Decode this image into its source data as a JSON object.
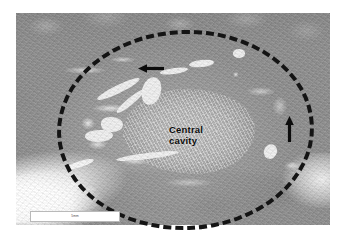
{
  "figure": {
    "type": "histopathology-micrograph",
    "modality": "grayscale low-power light microscopy",
    "annotations": {
      "region_outline": {
        "name": "dashed-ellipse",
        "style": "dashed",
        "color": "#141414",
        "meaning": "outlined lesion / tumour boundary"
      },
      "arrows": [
        {
          "name": "arrow-left",
          "direction": "left",
          "color": "#0c0c0c"
        },
        {
          "name": "arrow-up",
          "direction": "up",
          "color": "#0c0c0c"
        }
      ],
      "labels": [
        {
          "name": "central-cavity-label",
          "line1": "Central",
          "line2": "cavity",
          "color": "#0c0c0c"
        }
      ]
    },
    "scale_bar": {
      "text": "5mm",
      "background": "#ffffff",
      "border": "#b9b9b9"
    },
    "palette": {
      "background": "#ffffff",
      "tissue_mid": "#9a9a9a",
      "tissue_light": "#c3c3c3",
      "tissue_dark": "#8a8a8a",
      "annotation": "#141414"
    }
  }
}
